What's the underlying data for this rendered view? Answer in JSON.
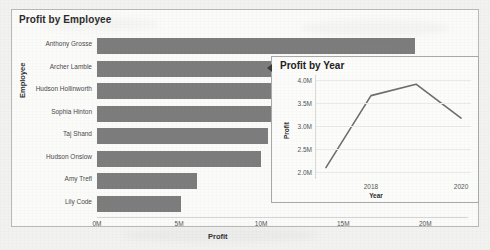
{
  "document": {
    "background_color": "#f2f2f1",
    "panel_background": "#fbfbfa",
    "panel_border_color": "#b9b9b6"
  },
  "bar_chart": {
    "title": "Profit by Employee",
    "xlabel": "Profit",
    "ylabel": "Employee",
    "bar_color": "#7d7d7d"
  },
  "line_chart": {
    "title": "Profit by Year",
    "xlabel": "Year",
    "ylabel": "Profit",
    "line_color": "#6e6e6e"
  },
  "chart_data": [
    {
      "type": "bar",
      "orientation": "horizontal",
      "title": "Profit by Employee",
      "xlabel": "Profit",
      "ylabel": "Employee",
      "categories": [
        "Anthony Grosse",
        "Archer Lamble",
        "Hudson Hollinworth",
        "Sophia Hinton",
        "Taj Shand",
        "Hudson Onslow",
        "Amy Trefl",
        "Lily Code"
      ],
      "values": [
        19.4,
        15.2,
        14.3,
        13.9,
        10.4,
        10.0,
        6.1,
        5.1
      ],
      "value_unit": "M",
      "xlim": [
        0,
        22.6
      ],
      "xticks": [
        0,
        5,
        10,
        15,
        20
      ],
      "xtick_labels": [
        "0M",
        "5M",
        "10M",
        "15M",
        "20M"
      ],
      "grid": false,
      "legend": false
    },
    {
      "type": "line",
      "title": "Profit by Year",
      "xlabel": "Year",
      "ylabel": "Profit",
      "x": [
        2017,
        2018,
        2019,
        2020
      ],
      "xticks": [
        2018,
        2020
      ],
      "xtick_labels": [
        "2018",
        "2020"
      ],
      "values": [
        2.1,
        3.67,
        3.92,
        3.18
      ],
      "value_unit": "M",
      "ylim": [
        1.85,
        4.12
      ],
      "yticks": [
        2.0,
        2.5,
        3.0,
        3.5,
        4.0
      ],
      "ytick_labels": [
        "2.0M",
        "2.5M",
        "3.0M",
        "3.5M",
        "4.0M"
      ],
      "grid": true,
      "legend": false
    }
  ]
}
